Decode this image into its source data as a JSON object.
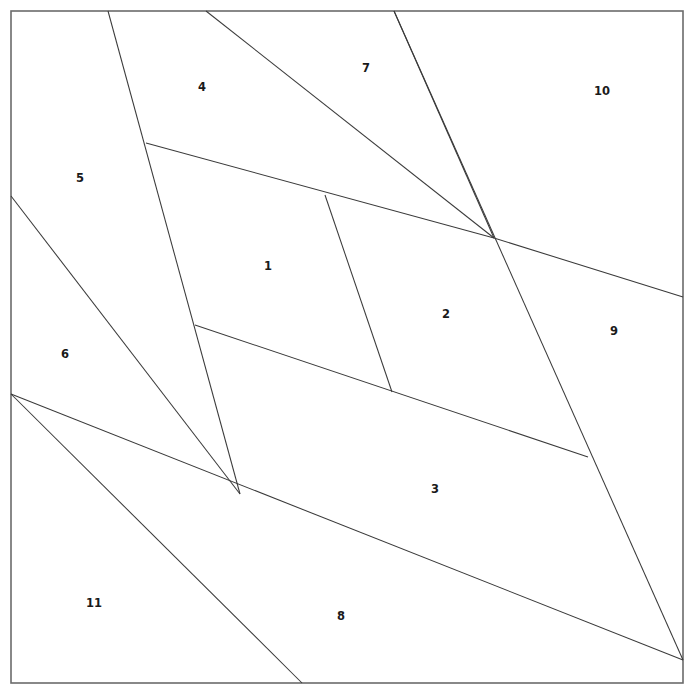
{
  "figure": {
    "width": 693,
    "height": 696,
    "background_color": "#ffffff",
    "frame_color": "#6b6b6b",
    "line_color": "#3a3a3a"
  },
  "frame": {
    "x": 11,
    "y": 11,
    "width": 672,
    "height": 672
  },
  "chart_data": {
    "type": "diagram",
    "title": "",
    "xlabel": "",
    "ylabel": "",
    "xlim": [
      0,
      693
    ],
    "ylim": [
      0,
      696
    ],
    "grid": false,
    "legend": "none",
    "region_count": 11,
    "line_count": 11,
    "lines": [
      {
        "name": "cut-a",
        "x1": 108,
        "y1": 11,
        "x2": 240,
        "y2": 494
      },
      {
        "name": "cut-b",
        "x1": 206,
        "y1": 11,
        "x2": 494,
        "y2": 238
      },
      {
        "name": "cut-c",
        "x1": 394,
        "y1": 11,
        "x2": 494,
        "y2": 238
      },
      {
        "name": "cut-d",
        "x1": 394,
        "y1": 11,
        "x2": 683,
        "y2": 660
      },
      {
        "name": "cut-e",
        "x1": 146,
        "y1": 143,
        "x2": 494,
        "y2": 238
      },
      {
        "name": "cut-f",
        "x1": 325,
        "y1": 195,
        "x2": 392,
        "y2": 392
      },
      {
        "name": "cut-g",
        "x1": 195,
        "y1": 325,
        "x2": 588,
        "y2": 457
      },
      {
        "name": "cut-h",
        "x1": 11,
        "y1": 196,
        "x2": 240,
        "y2": 494
      },
      {
        "name": "cut-i",
        "x1": 11,
        "y1": 394,
        "x2": 683,
        "y2": 660
      },
      {
        "name": "cut-j",
        "x1": 11,
        "y1": 394,
        "x2": 302,
        "y2": 683
      },
      {
        "name": "cut-k",
        "x1": 494,
        "y1": 238,
        "x2": 683,
        "y2": 297
      }
    ],
    "labels": [
      {
        "text": "1",
        "x": 268,
        "y": 266
      },
      {
        "text": "2",
        "x": 446,
        "y": 314
      },
      {
        "text": "3",
        "x": 435,
        "y": 489
      },
      {
        "text": "4",
        "x": 202,
        "y": 87
      },
      {
        "text": "5",
        "x": 80,
        "y": 178
      },
      {
        "text": "6",
        "x": 65,
        "y": 354
      },
      {
        "text": "7",
        "x": 366,
        "y": 68
      },
      {
        "text": "8",
        "x": 341,
        "y": 616
      },
      {
        "text": "9",
        "x": 614,
        "y": 331
      },
      {
        "text": "10",
        "x": 602,
        "y": 91
      },
      {
        "text": "11",
        "x": 94,
        "y": 603
      }
    ]
  }
}
